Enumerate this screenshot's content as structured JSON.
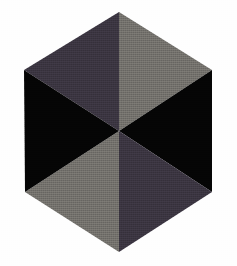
{
  "canvas": {
    "width": 237,
    "height": 266,
    "background_color": "#fefefe"
  },
  "figure": {
    "name": "hexagon-six-sector-color-wheel",
    "shape": "hexagon",
    "sector_count": 6,
    "center": {
      "x": 119,
      "y": 131
    },
    "vertices": [
      {
        "label": "top",
        "x": 119,
        "y": 12
      },
      {
        "label": "upper-right",
        "x": 212,
        "y": 70
      },
      {
        "label": "lower-right",
        "x": 212,
        "y": 192
      },
      {
        "label": "bottom",
        "x": 119,
        "y": 252
      },
      {
        "label": "lower-left",
        "x": 25,
        "y": 192
      },
      {
        "label": "upper-left",
        "x": 24,
        "y": 70
      }
    ],
    "outline_color": "#2a2730"
  },
  "palette": {
    "dark_violet_gray": "#3a3440",
    "medium_warm_gray": "#716f6a",
    "black": "#050505"
  },
  "sectors": [
    {
      "name": "sector-top-left",
      "position": "top-left",
      "color": "#3a3440",
      "color_name": "dark violet gray",
      "points": "119,131 24,70 119,12"
    },
    {
      "name": "sector-top-right",
      "position": "top-right",
      "color": "#716f6a",
      "color_name": "medium warm gray",
      "points": "119,131 119,12 212,70"
    },
    {
      "name": "sector-right",
      "position": "right",
      "color": "#050505",
      "color_name": "black",
      "points": "119,131 212,70 212,192"
    },
    {
      "name": "sector-bottom-right",
      "position": "bottom-right",
      "color": "#3a3440",
      "color_name": "dark violet gray",
      "points": "119,131 212,192 119,252"
    },
    {
      "name": "sector-bottom-left",
      "position": "bottom-left",
      "color": "#716f6a",
      "color_name": "medium warm gray",
      "points": "119,131 119,252 25,192"
    },
    {
      "name": "sector-left",
      "position": "left",
      "color": "#050505",
      "color_name": "black",
      "points": "119,131 25,192 24,70"
    }
  ]
}
